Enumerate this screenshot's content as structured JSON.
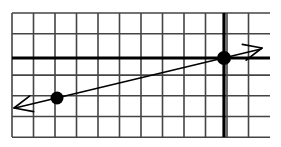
{
  "figure": {
    "title": "",
    "width": 281,
    "height": 147,
    "background_color": "#ffffff"
  },
  "chart_data": {
    "type": "line",
    "title": "",
    "subtitle": "",
    "xlabel": "",
    "ylabel": "",
    "grid": {
      "visible": true,
      "columns": 12,
      "rows": 6,
      "cell_width": 21.5,
      "cell_height": 20.7,
      "left": 12,
      "top": 13,
      "right": 270,
      "bottom": 137,
      "minor_color": "#444444",
      "minor_width": 1.6,
      "axis_color": "#000000",
      "axis_width": 3.2
    },
    "axes": {
      "x_axis_pixel_y": 58,
      "y_axis_pixel_x": 224,
      "origin_column_index": 10,
      "origin_row_index": 2,
      "xlim": [
        -10,
        2
      ],
      "ylim": [
        -4,
        2
      ],
      "xticks": [
        -10,
        -9,
        -8,
        -7,
        -6,
        -5,
        -4,
        -3,
        -2,
        -1,
        0,
        1,
        2
      ],
      "yticks": [
        -4,
        -3,
        -2,
        -1,
        0,
        1,
        2
      ],
      "tick_labels_visible": false
    },
    "series": [
      {
        "name": "line",
        "kind": "line-with-arrows",
        "color": "#000000",
        "stroke_width": 1.6,
        "slope": 0.25,
        "intercept": 0,
        "equation": "y = (1/4)x",
        "arrow_start": true,
        "arrow_end": true,
        "endpoint_start_pixel": [
          14,
          108
        ],
        "endpoint_end_pixel": [
          262,
          48
        ],
        "points_pixel": [
          [
            57,
            98
          ],
          [
            224,
            58
          ]
        ],
        "x": [
          -8,
          0
        ],
        "y": [
          -2,
          0
        ]
      }
    ],
    "markers": [
      {
        "name": "point-left",
        "x": -8,
        "y": -2,
        "pixel": [
          57,
          98
        ],
        "radius": 6.5,
        "color": "#000000",
        "filled": true,
        "label": ""
      },
      {
        "name": "point-right",
        "x": 0,
        "y": 0,
        "pixel": [
          224,
          58
        ],
        "radius": 7,
        "color": "#000000",
        "filled": true,
        "label": ""
      }
    ],
    "legend": {
      "visible": false,
      "position": "none",
      "entries": []
    },
    "annotations": []
  }
}
